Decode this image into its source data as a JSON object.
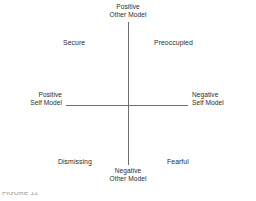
{
  "figure": {
    "axes": {
      "vertical": {
        "top_label": {
          "line1": "Positive",
          "line2": "Other Model"
        },
        "bottom_label": {
          "line1": "Negative",
          "line2": "Other Model"
        }
      },
      "horizontal": {
        "left_label": {
          "line1": "Positive",
          "line2": "Self Model"
        },
        "right_label": {
          "line1": "Negative",
          "line2": "Self Model"
        }
      },
      "line_color": "#6d6d6d"
    },
    "quadrants": [
      {
        "id": "secure",
        "label": "Secure",
        "position": "top-left"
      },
      {
        "id": "preoccupied",
        "label": "Preoccupied",
        "position": "top-right"
      },
      {
        "id": "dismissing",
        "label": "Dismissing",
        "position": "bottom-left"
      },
      {
        "id": "fearful",
        "label": "Fearful",
        "position": "bottom-right"
      }
    ],
    "caption_clipped": "FIGURE 11",
    "text_color": "#2b2b2b",
    "background_color": "#ffffff"
  }
}
